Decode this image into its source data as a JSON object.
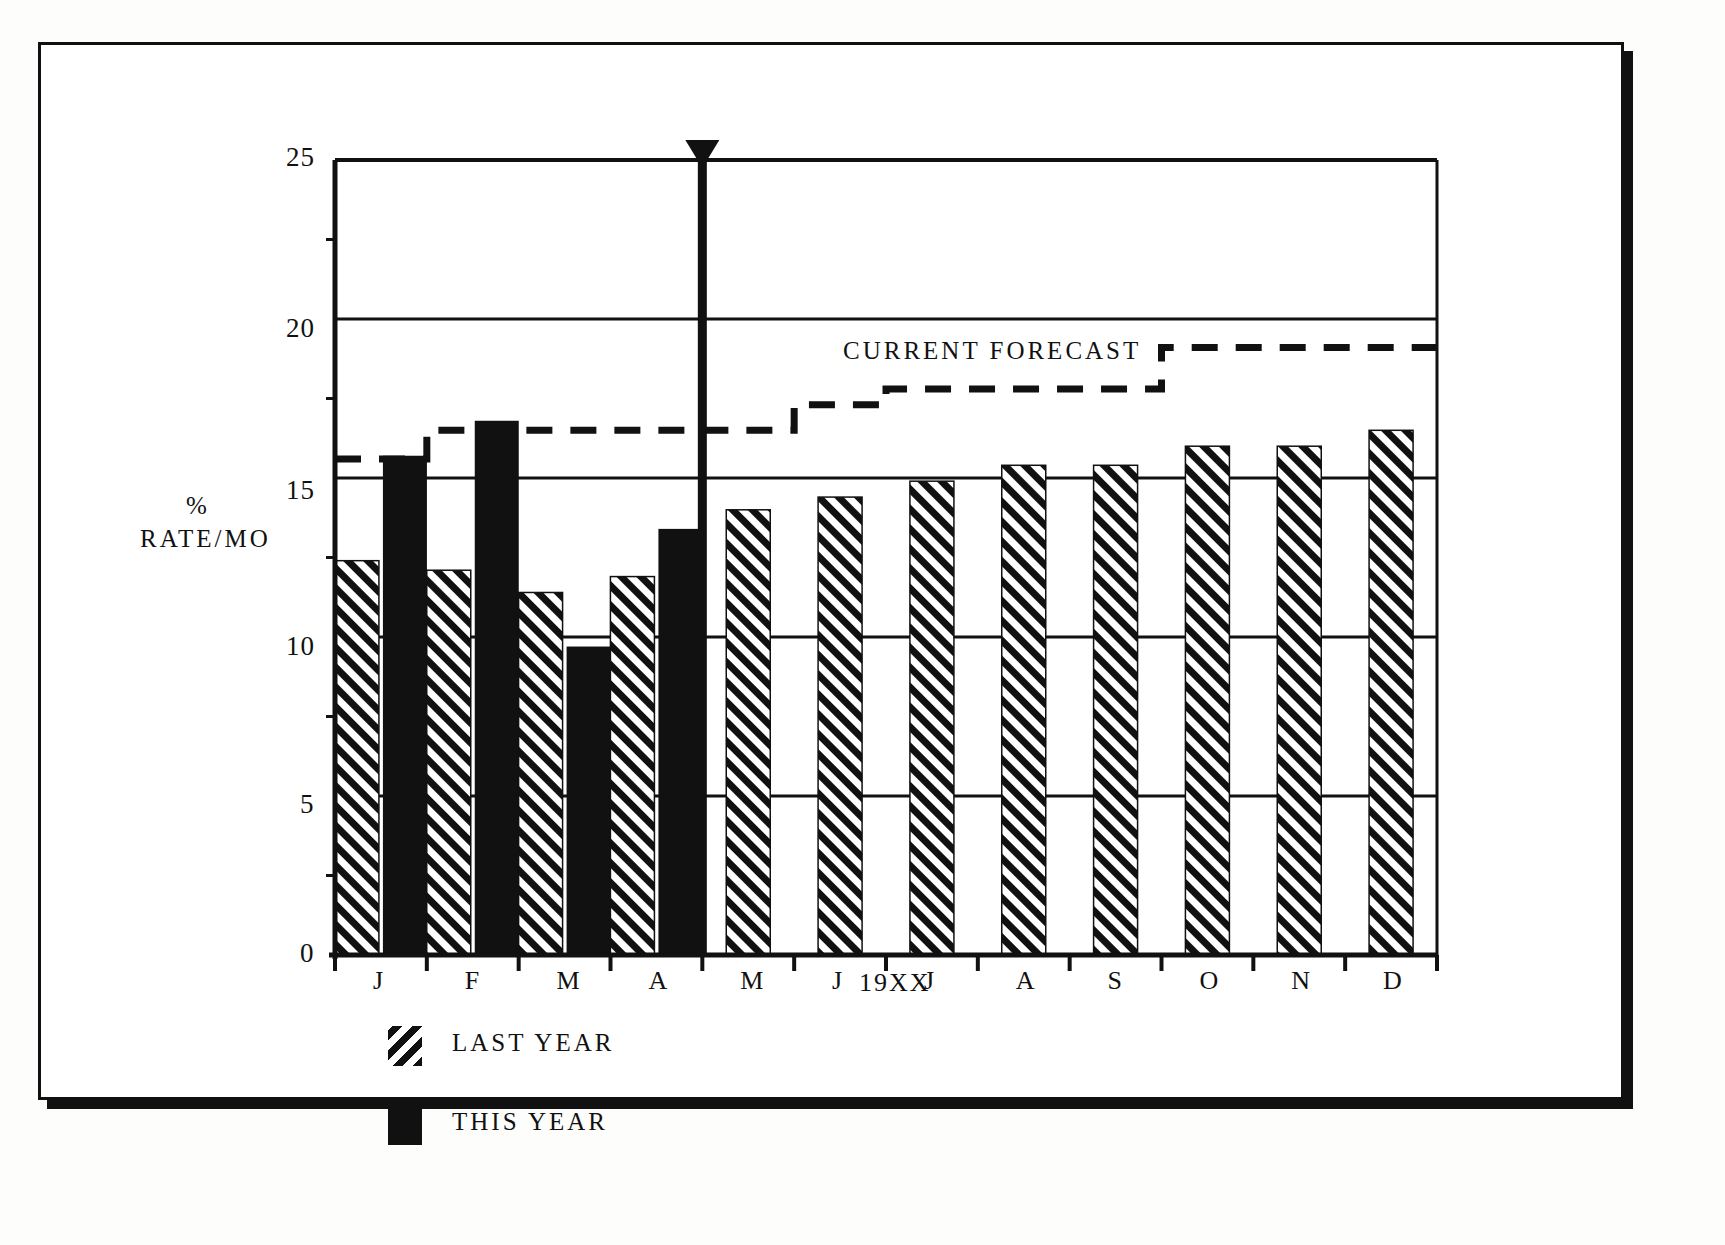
{
  "figure": {
    "y_axis_title_line1": "%",
    "y_axis_title_line2": "RATE/MO",
    "x_axis_title": "19XX",
    "forecast_annotation": "CURRENT FORECAST",
    "legend": [
      {
        "key": "last-year",
        "label": "LAST YEAR",
        "pattern": "hatched"
      },
      {
        "key": "this-year",
        "label": "THIS YEAR",
        "pattern": "solid"
      }
    ],
    "y_ticks": [
      "0",
      "5",
      "10",
      "15",
      "20",
      "25"
    ],
    "month_ticks": [
      "J",
      "F",
      "M",
      "A",
      "M",
      "J",
      "J",
      "A",
      "S",
      "O",
      "N",
      "D"
    ],
    "colors": {
      "ink": "#111111",
      "paper": "#ffffff"
    }
  },
  "chart_data": {
    "type": "bar",
    "title": "",
    "subtitle": "",
    "xlabel": "19XX",
    "ylabel": "% RATE/MO",
    "ylim": [
      0,
      25
    ],
    "ytick_values": [
      0,
      5,
      10,
      15,
      20,
      25
    ],
    "grid": "horizontal",
    "legend_position": "below-left",
    "categories": [
      "J",
      "F",
      "M",
      "A",
      "M",
      "J",
      "J",
      "A",
      "S",
      "O",
      "N",
      "D"
    ],
    "series": [
      {
        "name": "LAST YEAR",
        "pattern": "hatched",
        "values": [
          12.4,
          12.1,
          11.4,
          11.9,
          14.0,
          14.4,
          14.9,
          15.4,
          15.4,
          16.0,
          16.0,
          16.5
        ]
      },
      {
        "name": "THIS YEAR",
        "pattern": "solid",
        "values": [
          15.7,
          16.8,
          9.7,
          13.4,
          null,
          null,
          null,
          null,
          null,
          null,
          null,
          null
        ]
      },
      {
        "name": "CURRENT FORECAST",
        "pattern": "dashed-step",
        "style": "step",
        "values": [
          15.6,
          16.5,
          16.5,
          16.5,
          16.5,
          17.3,
          17.8,
          17.8,
          17.8,
          19.1,
          19.1,
          19.1
        ]
      }
    ],
    "annotations": [
      {
        "name": "today-marker",
        "type": "vertical-arrow",
        "x_category_boundary": "A|M",
        "label": ""
      }
    ]
  }
}
